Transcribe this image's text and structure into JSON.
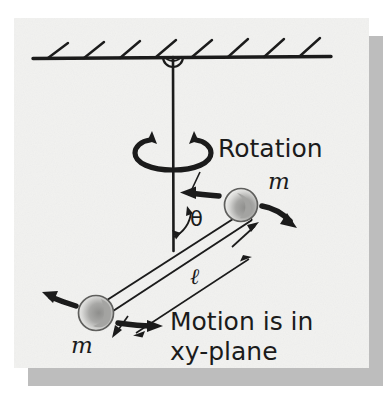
{
  "figure": {
    "background_color": "#f2f2f0",
    "paper_color": "#f2f2f0",
    "ink_color": "#1b1b1b",
    "shadow_color": "#b9b9b9",
    "ball_fill": "#ededeb",
    "ball_shade": "#9a9a98"
  },
  "labels": {
    "rotation": "Rotation",
    "theta": "θ",
    "length": "ℓ",
    "mass_upper": "m",
    "mass_lower": "m",
    "motion_line1": "Motion is in",
    "motion_line2": "xy-plane"
  },
  "geometry": {
    "ceiling_y": 58,
    "ceiling_x_start": 33,
    "ceiling_x_end": 331,
    "hatch_count": 8,
    "pivot_x": 173,
    "pivot_y": 58,
    "pivot_radius": 9,
    "rod_bottom_y": 251,
    "ball_upper": {
      "cx": 241,
      "cy": 205,
      "r": 17
    },
    "ball_lower": {
      "cx": 96,
      "cy": 313,
      "r": 18
    },
    "angle_theta_degrees": 38
  },
  "elements": {
    "ceiling": "hatched-fixed-support",
    "pivot": "bearing-pivot",
    "vertical_rod": "rotation-axis",
    "cross_rod": "rigid-rod-between-masses",
    "rotation_arrow": "curved-rotation-arrow",
    "velocity_arrow_upper": "velocity-arrow-upper-mass",
    "velocity_arrow_lower": "velocity-arrow-lower-mass",
    "centripetal_arrow_upper": "centripetal-arrow-upper-mass",
    "centripetal_arrow_lower": "centripetal-arrow-lower-mass",
    "dimension_line": "length-dimension-line"
  }
}
